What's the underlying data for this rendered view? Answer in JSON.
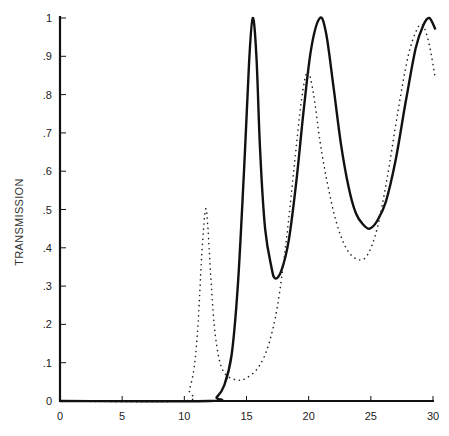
{
  "chart_data": {
    "type": "line",
    "title": "",
    "xlabel": "",
    "ylabel": "TRANSMISSION",
    "xlim": [
      0,
      30.5
    ],
    "ylim": [
      0,
      1
    ],
    "grid": false,
    "legend": null,
    "x_ticks": [
      0,
      5,
      10,
      15,
      20,
      25,
      30
    ],
    "x_tick_labels": [
      "0",
      "5",
      "10",
      "15",
      "20",
      "25",
      "30"
    ],
    "y_ticks": [
      0,
      0.1,
      0.2,
      0.3,
      0.4,
      0.5,
      0.6,
      0.7,
      0.8,
      0.9,
      1
    ],
    "y_tick_labels": [
      "0",
      ".1",
      ".2",
      ".3",
      ".4",
      ".5",
      ".6",
      ".7",
      ".8",
      ".9",
      "1"
    ],
    "series": [
      {
        "name": "solid",
        "style": "solid",
        "color": "#111111",
        "points": [
          [
            0,
            0
          ],
          [
            12.0,
            0
          ],
          [
            12.6,
            0.01
          ],
          [
            13.2,
            0.04
          ],
          [
            13.8,
            0.12
          ],
          [
            14.3,
            0.3
          ],
          [
            14.8,
            0.6
          ],
          [
            15.2,
            0.88
          ],
          [
            15.5,
            1.0
          ],
          [
            15.8,
            0.9
          ],
          [
            16.1,
            0.65
          ],
          [
            16.5,
            0.45
          ],
          [
            17.0,
            0.35
          ],
          [
            17.3,
            0.32
          ],
          [
            17.8,
            0.34
          ],
          [
            18.4,
            0.42
          ],
          [
            19.0,
            0.57
          ],
          [
            19.6,
            0.76
          ],
          [
            20.2,
            0.92
          ],
          [
            20.9,
            1.0
          ],
          [
            21.4,
            0.96
          ],
          [
            22.0,
            0.82
          ],
          [
            22.6,
            0.67
          ],
          [
            23.2,
            0.56
          ],
          [
            23.8,
            0.49
          ],
          [
            24.4,
            0.46
          ],
          [
            24.9,
            0.45
          ],
          [
            25.5,
            0.47
          ],
          [
            26.2,
            0.52
          ],
          [
            27.0,
            0.63
          ],
          [
            27.8,
            0.78
          ],
          [
            28.6,
            0.92
          ],
          [
            29.2,
            0.98
          ],
          [
            29.7,
            1.0
          ],
          [
            30.2,
            0.97
          ]
        ]
      },
      {
        "name": "dotted",
        "style": "dotted",
        "color": "#222222",
        "points": [
          [
            0,
            0
          ],
          [
            9.9,
            0
          ],
          [
            10.4,
            0.03
          ],
          [
            10.8,
            0.09
          ],
          [
            11.1,
            0.2
          ],
          [
            11.4,
            0.38
          ],
          [
            11.7,
            0.5
          ],
          [
            11.9,
            0.45
          ],
          [
            12.1,
            0.34
          ],
          [
            12.4,
            0.2
          ],
          [
            12.8,
            0.11
          ],
          [
            13.3,
            0.07
          ],
          [
            14.2,
            0.055
          ],
          [
            15.0,
            0.06
          ],
          [
            16.0,
            0.09
          ],
          [
            16.8,
            0.15
          ],
          [
            17.5,
            0.25
          ],
          [
            18.2,
            0.42
          ],
          [
            18.8,
            0.6
          ],
          [
            19.4,
            0.78
          ],
          [
            19.9,
            0.86
          ],
          [
            20.4,
            0.8
          ],
          [
            20.9,
            0.68
          ],
          [
            21.5,
            0.57
          ],
          [
            22.2,
            0.47
          ],
          [
            23.0,
            0.4
          ],
          [
            23.9,
            0.37
          ],
          [
            24.7,
            0.38
          ],
          [
            25.5,
            0.45
          ],
          [
            26.3,
            0.58
          ],
          [
            27.2,
            0.76
          ],
          [
            28.0,
            0.9
          ],
          [
            28.7,
            0.97
          ],
          [
            29.2,
            0.98
          ],
          [
            29.7,
            0.93
          ],
          [
            30.2,
            0.84
          ]
        ]
      }
    ]
  }
}
